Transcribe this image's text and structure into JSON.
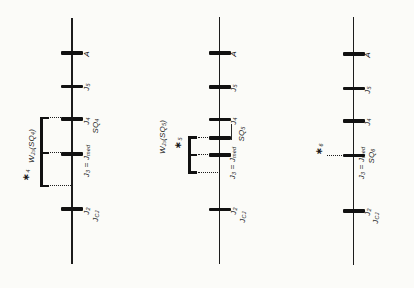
{
  "figure": {
    "background": "#fbfbf8",
    "ink": "#111111",
    "panels": [
      {
        "name": "panel-left",
        "line": {
          "x": 72,
          "y1": 18,
          "y2": 264
        },
        "ticks": [
          {
            "y": 53,
            "name": "tick-a"
          },
          {
            "y": 86.5,
            "name": "tick-j5"
          },
          {
            "y": 119,
            "name": "tick-j4-sq4"
          },
          {
            "y": 154,
            "name": "tick-j3-jmed"
          },
          {
            "y": 209,
            "name": "tick-j2"
          }
        ],
        "bracket": {
          "x": 41.5,
          "y1": 116.6,
          "y2": 187.4,
          "arms": [
            118,
            153,
            186
          ],
          "len": 7.5
        },
        "dots": [
          {
            "y": 118,
            "x1": 49.5,
            "x2": 60.5
          },
          {
            "y": 153,
            "x1": 49.5,
            "x2": 60.5
          },
          {
            "y": 186,
            "x1": 49.5,
            "x2": 70.5
          }
        ],
        "labels": [
          {
            "name": "tick-label-a",
            "x": 86.5,
            "y": 53.5,
            "tokens": [
              [
                "A",
                ""
              ]
            ]
          },
          {
            "name": "tick-label-j5",
            "x": 86.5,
            "y": 87,
            "tokens": [
              [
                "J",
                ""
              ],
              [
                "5",
                "s"
              ]
            ]
          },
          {
            "name": "tick-label-j4",
            "x": 86.5,
            "y": 120.5,
            "tokens": [
              [
                "J",
                ""
              ],
              [
                "4",
                "s"
              ]
            ]
          },
          {
            "name": "tick-label-sq4",
            "x": 95.5,
            "y": 126,
            "tokens": [
              [
                "SQ",
                ""
              ],
              [
                "4",
                "s"
              ]
            ]
          },
          {
            "name": "tick-label-j3-jmed",
            "x": 86.5,
            "y": 161,
            "tokens": [
              [
                "J",
                ""
              ],
              [
                "3",
                "s"
              ],
              [
                " = ",
                ""
              ],
              [
                "J",
                ""
              ],
              [
                "med",
                "s"
              ]
            ]
          },
          {
            "name": "tick-label-j2",
            "x": 86.5,
            "y": 210.5,
            "tokens": [
              [
                "J",
                ""
              ],
              [
                "2",
                "s"
              ]
            ]
          },
          {
            "name": "tick-label-jcj",
            "x": 95.5,
            "y": 216,
            "tokens": [
              [
                "J",
                ""
              ],
              [
                "CJ",
                "s"
              ]
            ]
          },
          {
            "name": "window-label-wj3-sq4",
            "x": 32,
            "y": 146,
            "tokens": [
              [
                "W",
                ""
              ],
              [
                "J",
                "s"
              ],
              [
                "3",
                "s2"
              ],
              [
                "(SQ",
                ""
              ],
              [
                "4",
                "s"
              ],
              [
                ")",
                ""
              ]
            ]
          },
          {
            "name": "star-marker-4",
            "x": 27,
            "y": 175,
            "tokens": [
              [
                "∗",
                "star"
              ],
              [
                "4",
                "s"
              ]
            ]
          }
        ]
      },
      {
        "name": "panel-middle",
        "line": {
          "x": 219.5,
          "y1": 17,
          "y2": 264
        },
        "ticks": [
          {
            "y": 53,
            "name": "tick-a"
          },
          {
            "y": 87,
            "name": "tick-j5"
          },
          {
            "y": 119.5,
            "name": "tick-j4"
          },
          {
            "y": 138,
            "name": "tick-sq5"
          },
          {
            "y": 155,
            "name": "tick-j3-jmed"
          },
          {
            "y": 209.5,
            "name": "tick-j2"
          }
        ],
        "bracket": {
          "x": 189.5,
          "y1": 136.1,
          "y2": 173.9,
          "arms": [
            137.5,
            155,
            172.5
          ],
          "len": 7.5
        },
        "dots": [
          {
            "y": 137.5,
            "x1": 197.5,
            "x2": 208
          },
          {
            "y": 155,
            "x1": 197.5,
            "x2": 208
          },
          {
            "y": 172.5,
            "x1": 197.5,
            "x2": 218
          }
        ],
        "leader": {
          "x": 231,
          "y1": 124,
          "y2": 139.5
        },
        "labels": [
          {
            "name": "tick-label-a",
            "x": 234,
            "y": 53.5,
            "tokens": [
              [
                "A",
                ""
              ]
            ]
          },
          {
            "name": "tick-label-j5",
            "x": 234,
            "y": 88,
            "tokens": [
              [
                "J",
                ""
              ],
              [
                "5",
                "s"
              ]
            ]
          },
          {
            "name": "tick-label-j4",
            "x": 234,
            "y": 121,
            "tokens": [
              [
                "J",
                ""
              ],
              [
                "4",
                "s"
              ]
            ]
          },
          {
            "name": "tick-label-sq5",
            "x": 242,
            "y": 134,
            "tokens": [
              [
                "SQ",
                ""
              ],
              [
                "5",
                "s"
              ]
            ]
          },
          {
            "name": "tick-label-j3-jmed",
            "x": 232.5,
            "y": 162.5,
            "tokens": [
              [
                "J",
                ""
              ],
              [
                "3",
                "s"
              ],
              [
                " = ",
                ""
              ],
              [
                "J",
                ""
              ],
              [
                "med",
                "s"
              ]
            ]
          },
          {
            "name": "tick-label-j2",
            "x": 234,
            "y": 211,
            "tokens": [
              [
                "J",
                ""
              ],
              [
                "2",
                "s"
              ]
            ]
          },
          {
            "name": "tick-label-jcj",
            "x": 243,
            "y": 216.5,
            "tokens": [
              [
                "J",
                ""
              ],
              [
                "CJ",
                "s"
              ]
            ]
          },
          {
            "name": "window-label-wj3-sq5",
            "x": 162.5,
            "y": 137,
            "tokens": [
              [
                "W",
                ""
              ],
              [
                "J",
                "s"
              ],
              [
                "3",
                "s2"
              ],
              [
                "(SQ",
                ""
              ],
              [
                "5",
                "s"
              ],
              [
                ")",
                ""
              ]
            ]
          },
          {
            "name": "star-marker-5",
            "x": 178.5,
            "y": 143,
            "tokens": [
              [
                "∗",
                "star"
              ],
              [
                "5",
                "s"
              ]
            ]
          }
        ]
      },
      {
        "name": "panel-right",
        "line": {
          "x": 353.5,
          "y1": 17,
          "y2": 265
        },
        "ticks": [
          {
            "y": 54,
            "name": "tick-a"
          },
          {
            "y": 88.5,
            "name": "tick-j5"
          },
          {
            "y": 121,
            "name": "tick-j4"
          },
          {
            "y": 155.5,
            "name": "tick-j3-jmed-sq6"
          },
          {
            "y": 211,
            "name": "tick-j2"
          }
        ],
        "dots": [
          {
            "y": 155.5,
            "x1": 326.5,
            "x2": 342
          }
        ],
        "labels": [
          {
            "name": "tick-label-a",
            "x": 368,
            "y": 54.5,
            "tokens": [
              [
                "A",
                ""
              ]
            ]
          },
          {
            "name": "tick-label-j5",
            "x": 368,
            "y": 89.5,
            "tokens": [
              [
                "J",
                ""
              ],
              [
                "5",
                "s"
              ]
            ]
          },
          {
            "name": "tick-label-j4",
            "x": 368,
            "y": 122,
            "tokens": [
              [
                "J",
                ""
              ],
              [
                "4",
                "s"
              ]
            ]
          },
          {
            "name": "tick-label-j3-jmed",
            "x": 362,
            "y": 163,
            "tokens": [
              [
                "J",
                ""
              ],
              [
                "3",
                "s"
              ],
              [
                " = ",
                ""
              ],
              [
                "J",
                ""
              ],
              [
                "med",
                "s"
              ]
            ]
          },
          {
            "name": "tick-label-sq6",
            "x": 371.5,
            "y": 156,
            "tokens": [
              [
                "SQ",
                ""
              ],
              [
                "6",
                "s"
              ]
            ]
          },
          {
            "name": "tick-label-j2",
            "x": 368,
            "y": 212,
            "tokens": [
              [
                "J",
                ""
              ],
              [
                "2",
                "s"
              ]
            ]
          },
          {
            "name": "tick-label-jcj",
            "x": 376,
            "y": 218,
            "tokens": [
              [
                "J",
                ""
              ],
              [
                "CJ",
                "s"
              ]
            ]
          },
          {
            "name": "star-marker-6",
            "x": 320,
            "y": 148.5,
            "tokens": [
              [
                "∗",
                "star"
              ],
              [
                "6",
                "s"
              ]
            ]
          }
        ]
      }
    ]
  }
}
